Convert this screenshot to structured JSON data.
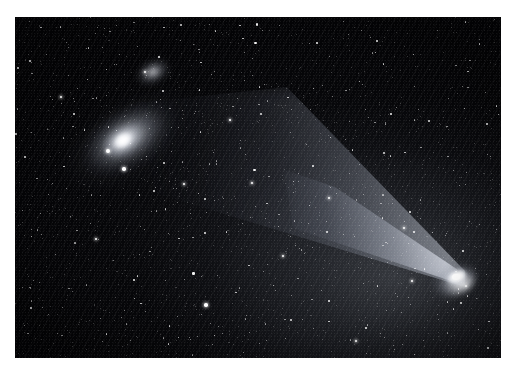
{
  "scene": {
    "kind": "astrophotograph",
    "description": "Wide-field astronomical photograph showing a bright comet with a broad fan-shaped dust tail at right and the Andromeda Galaxy with companion at upper left, over a dense star field",
    "background_color": "#ffffff",
    "sky_color": "#030305",
    "star_color": "#ffffff"
  },
  "frame": {
    "left": 15,
    "top": 17,
    "width": 486,
    "height": 341,
    "mat_color": "#ffffff"
  },
  "objects": [
    {
      "name": "andromeda-galaxy",
      "label": "Spiral galaxy (M31)",
      "center_x": 108,
      "center_y": 122,
      "position_angle_deg": -33,
      "brightness": "bright nucleus with extended elliptical halo"
    },
    {
      "name": "companion-galaxy",
      "label": "Companion galaxy (M110)",
      "center_x": 138,
      "center_y": 55,
      "position_angle_deg": -28,
      "brightness": "small diffuse elliptical patch"
    },
    {
      "name": "comet",
      "label": "Comet nucleus and coma",
      "nucleus_x": 441,
      "nucleus_y": 260,
      "tail_direction": "upper-left",
      "tail_span_deg": 42,
      "brightness": "saturated white nucleus"
    },
    {
      "name": "comet-tail",
      "label": "Fan-shaped dust tail",
      "origin_x": 441,
      "origin_y": 260,
      "extent_x": 135,
      "extent_y": 72
    }
  ],
  "bright_stars": [
    {
      "x": 108,
      "y": 151,
      "size": 4.0
    },
    {
      "x": 124,
      "y": 169,
      "size": 3.4
    },
    {
      "x": 206,
      "y": 305,
      "size": 3.6
    },
    {
      "x": 184,
      "y": 184,
      "size": 2.6
    },
    {
      "x": 252,
      "y": 183,
      "size": 2.4
    },
    {
      "x": 329,
      "y": 198,
      "size": 2.6
    },
    {
      "x": 404,
      "y": 228,
      "size": 2.4
    },
    {
      "x": 412,
      "y": 281,
      "size": 2.6
    },
    {
      "x": 61,
      "y": 97,
      "size": 2.4
    },
    {
      "x": 145,
      "y": 72,
      "size": 2.2
    },
    {
      "x": 283,
      "y": 256,
      "size": 2.4
    },
    {
      "x": 356,
      "y": 341,
      "size": 2.4
    },
    {
      "x": 466,
      "y": 286,
      "size": 2.4
    },
    {
      "x": 96,
      "y": 239,
      "size": 2.2
    },
    {
      "x": 230,
      "y": 120,
      "size": 2.2
    }
  ],
  "noise": {
    "streak_angle_deg": 114,
    "streak_opacity": 0.03,
    "grain_opacity": 0.07
  }
}
